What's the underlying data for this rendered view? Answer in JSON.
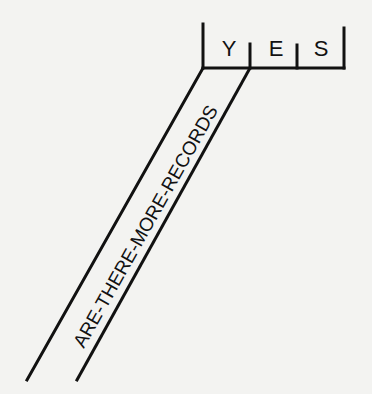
{
  "diagram": {
    "condition_label": "ARE-THERE-MORE-RECORDS",
    "answer_cells": [
      {
        "letter": "Y"
      },
      {
        "letter": "E"
      },
      {
        "letter": "S"
      }
    ],
    "answer_word": "YES",
    "colors": {
      "ink": "#111111",
      "paper": "#f3f3f1"
    }
  }
}
